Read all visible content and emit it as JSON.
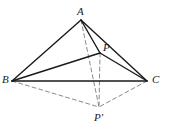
{
  "figure": {
    "background_color": "#ffffff",
    "solid_stroke_color": "#1a1a1a",
    "dashed_stroke_color": "#8a8a8a",
    "solid_stroke_width": 1.4,
    "dashed_stroke_width": 1.0,
    "dash_pattern": "4,3",
    "width": 170,
    "height": 132
  },
  "points": {
    "A": {
      "label": "A",
      "x": 81,
      "y": 20,
      "label_x": 77,
      "label_y": 6
    },
    "B": {
      "label": "B",
      "x": 12,
      "y": 81,
      "label_x": 2,
      "label_y": 74
    },
    "C": {
      "label": "C",
      "x": 147,
      "y": 81,
      "label_x": 152,
      "label_y": 74
    },
    "P": {
      "label": "P",
      "x": 100,
      "y": 53,
      "label_x": 103,
      "label_y": 42
    },
    "Pprime": {
      "label": "P'",
      "x": 99,
      "y": 107,
      "label_x": 94,
      "label_y": 112
    }
  },
  "edges": {
    "solid": [
      {
        "name": "edge-A-B",
        "from": "A",
        "to": "B"
      },
      {
        "name": "edge-A-C",
        "from": "A",
        "to": "C"
      },
      {
        "name": "edge-B-C",
        "from": "B",
        "to": "C"
      },
      {
        "name": "edge-A-P",
        "from": "A",
        "to": "P"
      },
      {
        "name": "edge-B-P",
        "from": "B",
        "to": "P"
      },
      {
        "name": "edge-P-C",
        "from": "P",
        "to": "C"
      }
    ],
    "dashed": [
      {
        "name": "edge-A-Pprime",
        "from": "A",
        "to": "Pprime"
      },
      {
        "name": "edge-P-Pprime",
        "from": "P",
        "to": "Pprime"
      },
      {
        "name": "edge-B-Pprime",
        "from": "B",
        "to": "Pprime"
      },
      {
        "name": "edge-C-Pprime",
        "from": "C",
        "to": "Pprime"
      }
    ]
  }
}
